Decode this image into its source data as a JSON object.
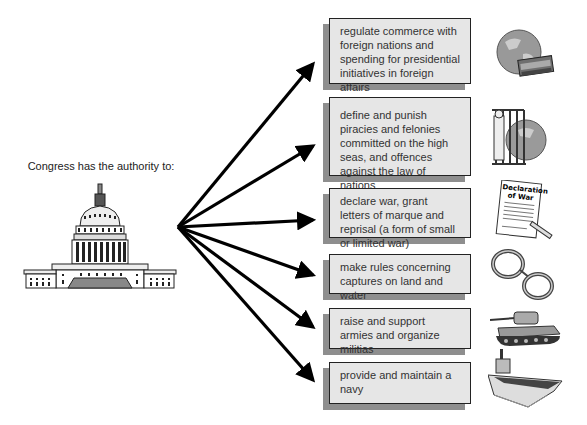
{
  "intro": {
    "text": "Congress has the authority to:"
  },
  "capitol": {
    "icon": "capitol-building-icon"
  },
  "powers": [
    {
      "text": "regulate commerce with foreign nations and spending for presidential initiatives in foreign affairs",
      "icon": "globe-money-icon"
    },
    {
      "text": "define and punish piracies and felonies committed on the high seas, and offences against the law of nations",
      "icon": "jail-globe-icon"
    },
    {
      "text": "declare war, grant letters of marque and reprisal (a form of small or limited war)",
      "icon": "declaration-of-war-document-icon",
      "icon_label": "Declaration of War"
    },
    {
      "text": "make rules concerning captures on land and water",
      "icon": "handcuffs-icon"
    },
    {
      "text": "raise and support armies and organize militias",
      "icon": "tank-icon"
    },
    {
      "text": "provide and maintain a navy",
      "icon": "aircraft-carrier-icon"
    }
  ],
  "colors": {
    "box_fill": "#e6e6e6",
    "box_border": "#222222",
    "shadow": "#8e8e8e",
    "arrow": "#000000"
  }
}
